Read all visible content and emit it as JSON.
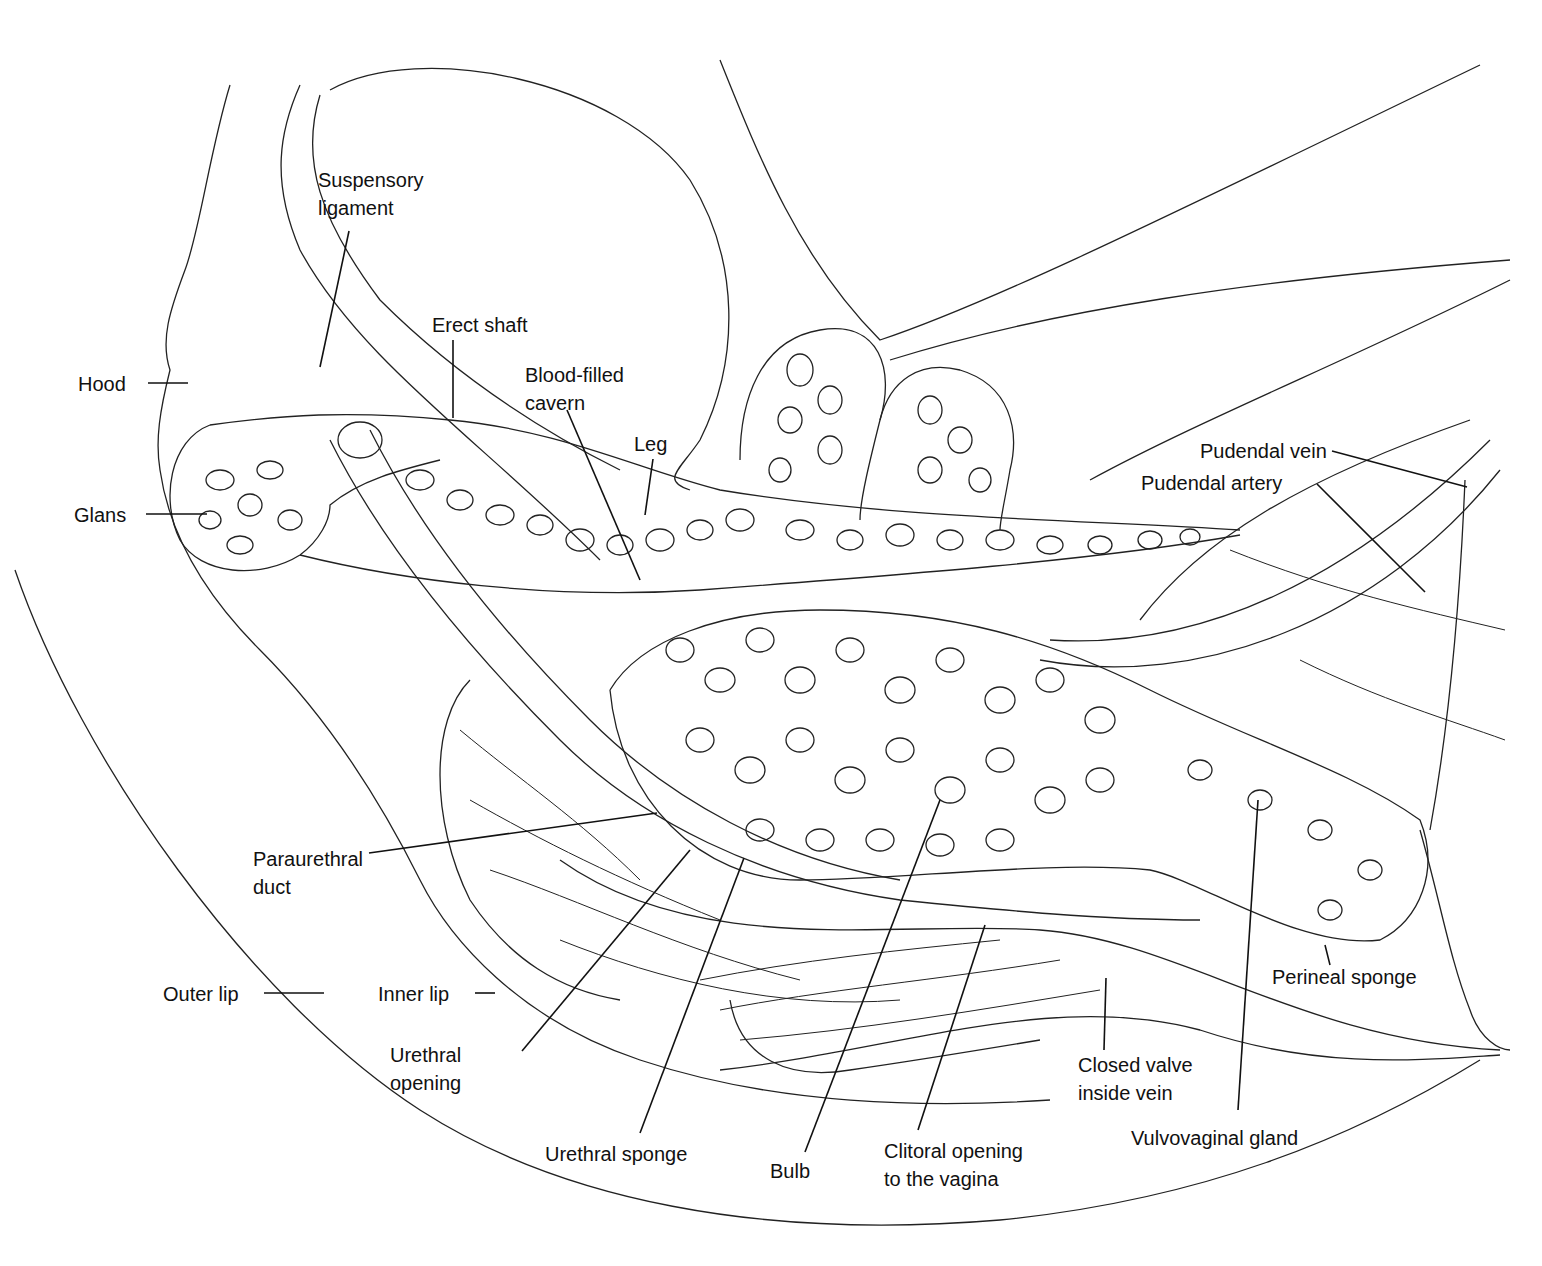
{
  "diagram": {
    "type": "anatomical line drawing",
    "labels": {
      "suspensory_ligament": [
        "Suspensory",
        "ligament"
      ],
      "erect_shaft": "Erect shaft",
      "hood": "Hood",
      "blood_filled_cavern": [
        "Blood-filled",
        "cavern"
      ],
      "leg": "Leg",
      "glans": "Glans",
      "pudendal_vein": "Pudendal vein",
      "pudendal_artery": "Pudendal artery",
      "paraurethral_duct": [
        "Paraurethral",
        "duct"
      ],
      "perineal_sponge": "Perineal sponge",
      "outer_lip": "Outer lip",
      "inner_lip": "Inner lip",
      "urethral_opening": [
        "Urethral",
        "opening"
      ],
      "closed_valve": [
        "Closed valve",
        "inside vein"
      ],
      "urethral_sponge": "Urethral sponge",
      "bulb": "Bulb",
      "clitoral_opening": [
        "Clitoral opening",
        "to the vagina"
      ],
      "vulvovaginal_gland": "Vulvovaginal gland"
    }
  }
}
